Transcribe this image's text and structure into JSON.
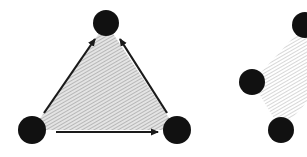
{
  "diagram": {
    "type": "graph",
    "colors": {
      "node": "#111111",
      "edge": "#1a1a1a",
      "triangle_fill": "#c8c8c8",
      "hatch": "#8a8a8a",
      "background": "#ffffff"
    },
    "triangle": {
      "nodes": [
        {
          "id": "top",
          "cx": 106,
          "cy": 23,
          "r": 13
        },
        {
          "id": "bottom-left",
          "cx": 32,
          "cy": 130,
          "r": 14
        },
        {
          "id": "bottom-right",
          "cx": 177,
          "cy": 130,
          "r": 14
        }
      ],
      "edges": [
        {
          "from": "bottom-left",
          "to": "top",
          "directed": true
        },
        {
          "from": "bottom-right",
          "to": "top",
          "directed": true
        },
        {
          "from": "bottom-left",
          "to": "bottom-right",
          "directed": true
        }
      ],
      "fill": "hatched-gray"
    },
    "square_partial": {
      "nodes": [
        {
          "id": "sq-left",
          "cx": 252,
          "cy": 82,
          "r": 13
        },
        {
          "id": "sq-bottom",
          "cx": 281,
          "cy": 130,
          "r": 13
        },
        {
          "id": "sq-top-right",
          "cx": 305,
          "cy": 25,
          "r": 13
        }
      ],
      "fill": "hatched-lines",
      "clipped": true
    }
  }
}
